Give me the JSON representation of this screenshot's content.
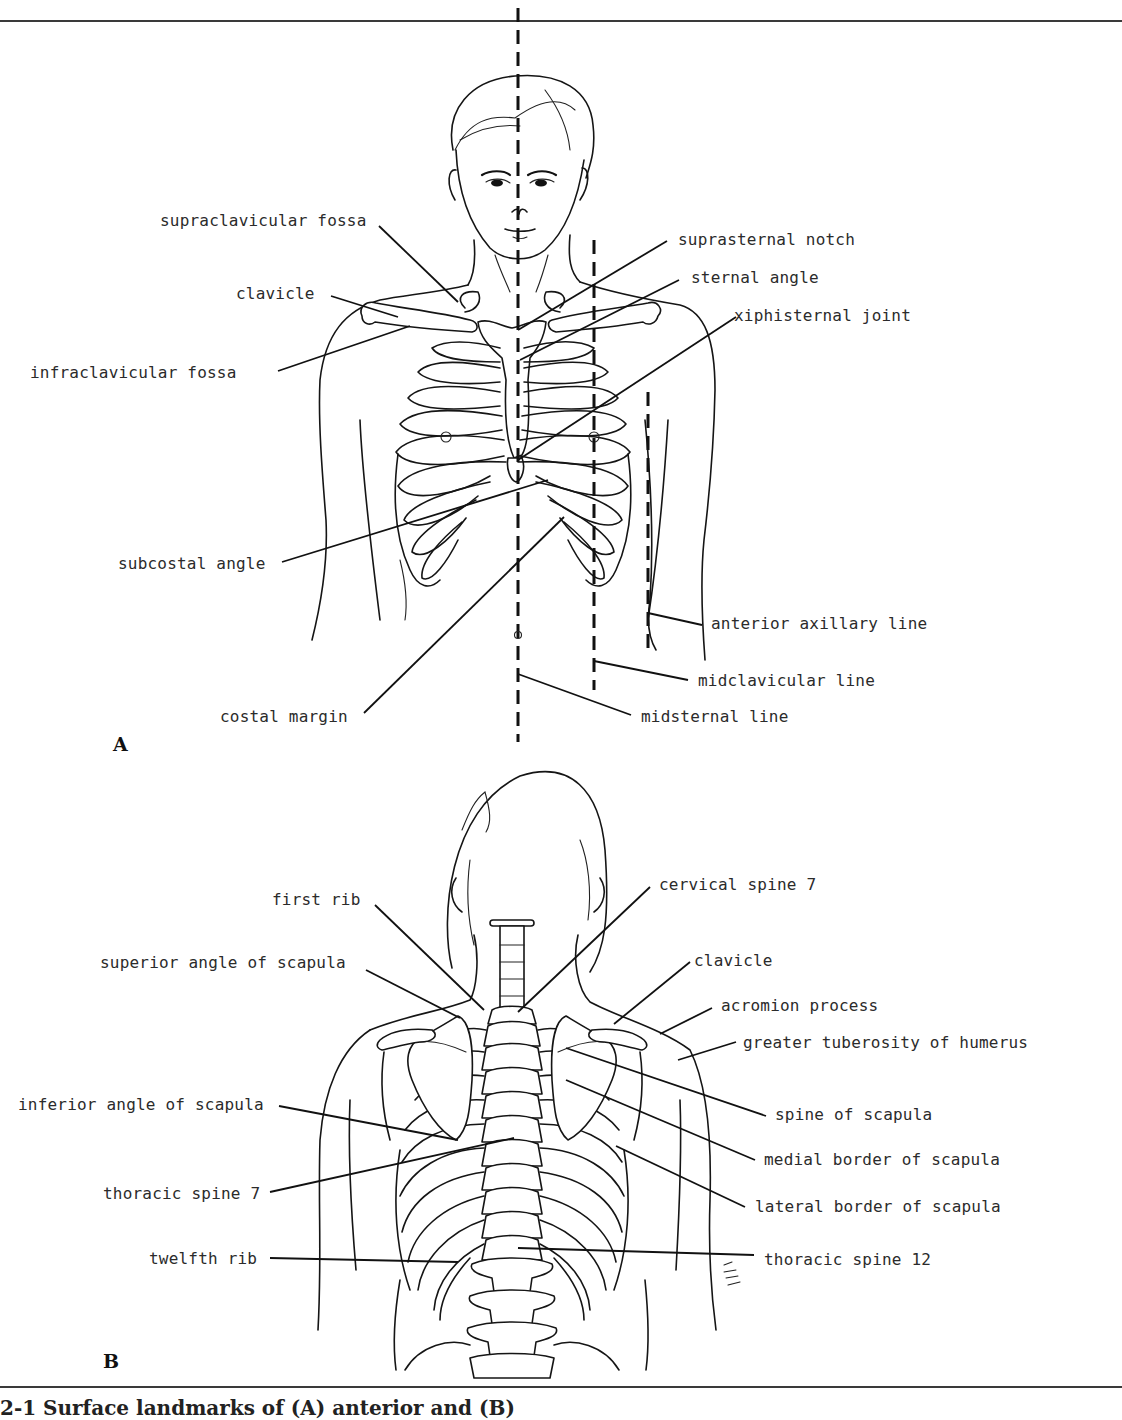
{
  "figure": {
    "panel_a": {
      "letter": "A",
      "view": "anterior",
      "labels": {
        "supraclavicular_fossa": "supraclavicular fossa",
        "clavicle": "clavicle",
        "infraclavicular_fossa": "infraclavicular fossa",
        "suprasternal_notch": "suprasternal notch",
        "sternal_angle": "sternal angle",
        "xiphisternal_joint": "xiphisternal joint",
        "subcostal_angle": "subcostal angle",
        "anterior_axillary_line": "anterior axillary line",
        "midclavicular_line": "midclavicular line",
        "costal_margin": "costal margin",
        "midsternal_line": "midsternal line"
      }
    },
    "panel_b": {
      "letter": "B",
      "view": "posterior",
      "labels": {
        "first_rib": "first rib",
        "cervical_spine_7": "cervical spine 7",
        "superior_angle_of_scapula": "superior angle of scapula",
        "clavicle": "clavicle",
        "acromion_process": "acromion process",
        "greater_tuberosity_of_humerus": "greater tuberosity of humerus",
        "inferior_angle_of_scapula": "inferior angle of scapula",
        "spine_of_scapula": "spine of scapula",
        "medial_border_of_scapula": "medial border of scapula",
        "thoracic_spine_7": "thoracic spine 7",
        "lateral_border_of_scapula": "lateral border of scapula",
        "twelfth_rib": "twelfth rib",
        "thoracic_spine_12": "thoracic spine 12"
      },
      "artist_signature": "EW"
    },
    "caption": "2-1 Surface landmarks of (A) anterior and (B)"
  }
}
